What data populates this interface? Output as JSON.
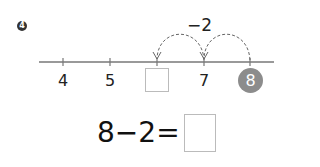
{
  "problem": {
    "number": "4"
  },
  "number_line": {
    "labels": [
      "4",
      "5",
      "",
      "7",
      "8"
    ],
    "highlighted": "8",
    "jump_label": "−2",
    "colors": {
      "line": "#777777",
      "highlight_circle": "#8c8c8c",
      "arc": "#666666"
    }
  },
  "equation": {
    "left": "8",
    "operator": "−",
    "right": "2",
    "equals": "="
  }
}
